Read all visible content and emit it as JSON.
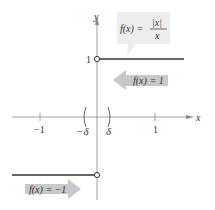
{
  "figure": {
    "function_label": "f(x) = |x| / x",
    "function_lhs": "f(x) =",
    "function_num": "|x|",
    "function_den": "x",
    "upper_branch_label": "f(x) = 1",
    "lower_branch_label": "f(x) = −1",
    "axes": {
      "x_label": "x",
      "y_label": "y",
      "x_ticks": [
        "−1",
        "1"
      ],
      "y_ticks": [
        "1"
      ],
      "delta_left": "−δ",
      "delta_right": "δ"
    },
    "colors": {
      "callout_bg": "#ededed",
      "arrow_bg": "#c8c8c8",
      "line": "#333333",
      "axis": "#888888"
    }
  }
}
